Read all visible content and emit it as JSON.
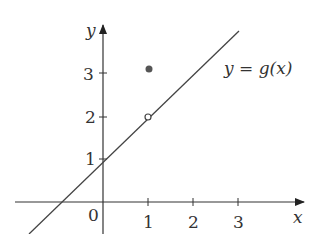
{
  "figure": {
    "function_label": "y = g(x)",
    "axis_x_label": "x",
    "axis_y_label": "y",
    "origin_label": "0",
    "x_ticks": [
      "1",
      "2",
      "3"
    ],
    "y_ticks": [
      "1",
      "2",
      "3"
    ],
    "line": {
      "slope": 1,
      "intercept": 1
    },
    "open_point": {
      "x": 1,
      "y": 2
    },
    "filled_point": {
      "x": 1,
      "y": 3
    }
  }
}
